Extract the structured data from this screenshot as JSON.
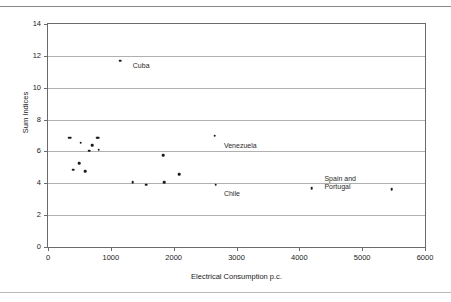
{
  "figure": {
    "background_color": "#ffffff",
    "axis_color": "#6a6a6a",
    "grid_color": "#b0b0b0",
    "marker_color": "#1b1b1b"
  },
  "chart_data": {
    "type": "scatter",
    "title": "",
    "xlabel": "Electrical Consumption p.c.",
    "ylabel": "Sum Indices",
    "xlim": [
      0,
      6000
    ],
    "ylim": [
      0,
      14
    ],
    "xticks": [
      0,
      1000,
      2000,
      3000,
      4000,
      5000,
      6000
    ],
    "xtick_labels": [
      "0",
      "1000",
      "2000",
      "3000",
      "4000",
      "5000",
      "6000"
    ],
    "yticks": [
      0,
      2,
      4,
      6,
      8,
      10,
      12,
      14
    ],
    "ytick_labels": [
      "0",
      "2",
      "4",
      "6",
      "8",
      "10",
      "12",
      "14"
    ],
    "grid": "horizontal",
    "legend": "none",
    "points": [
      {
        "x": 330,
        "y": 6.85,
        "label": ""
      },
      {
        "x": 355,
        "y": 6.85,
        "label": ""
      },
      {
        "x": 400,
        "y": 4.85,
        "label": ""
      },
      {
        "x": 500,
        "y": 5.25,
        "label": ""
      },
      {
        "x": 520,
        "y": 6.55,
        "label": ""
      },
      {
        "x": 590,
        "y": 4.75,
        "label": ""
      },
      {
        "x": 660,
        "y": 6.05,
        "label": ""
      },
      {
        "x": 700,
        "y": 6.4,
        "label": ""
      },
      {
        "x": 780,
        "y": 6.85,
        "label": ""
      },
      {
        "x": 800,
        "y": 6.85,
        "label": ""
      },
      {
        "x": 810,
        "y": 6.1,
        "label": ""
      },
      {
        "x": 1150,
        "y": 11.7,
        "label": "Cuba"
      },
      {
        "x": 1350,
        "y": 4.05,
        "label": ""
      },
      {
        "x": 1560,
        "y": 3.92,
        "label": ""
      },
      {
        "x": 1830,
        "y": 5.75,
        "label": ""
      },
      {
        "x": 1850,
        "y": 4.08,
        "label": ""
      },
      {
        "x": 2090,
        "y": 4.58,
        "label": ""
      },
      {
        "x": 2650,
        "y": 6.98,
        "label": "Venezuela"
      },
      {
        "x": 2670,
        "y": 3.9,
        "label": "Chile"
      },
      {
        "x": 4200,
        "y": 3.7,
        "label": "Spain and\nPortugal"
      },
      {
        "x": 5470,
        "y": 3.62,
        "label": ""
      }
    ],
    "annotations": [
      {
        "text": "Cuba",
        "x": 1350,
        "y": 11.35
      },
      {
        "text": "Venezuela",
        "x": 2800,
        "y": 6.35
      },
      {
        "text": "Chile",
        "x": 2800,
        "y": 3.3
      },
      {
        "text": "Spain and",
        "x": 4400,
        "y": 4.3
      },
      {
        "text": "Portugal",
        "x": 4400,
        "y": 3.75
      }
    ]
  }
}
